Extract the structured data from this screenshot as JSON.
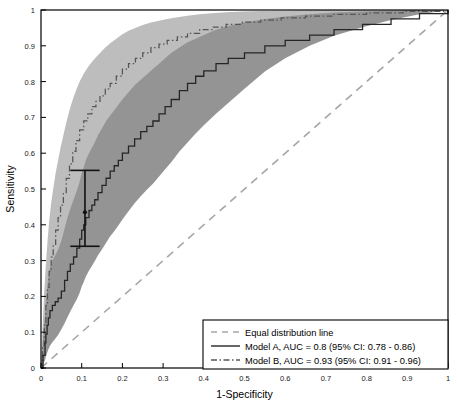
{
  "chart_data": {
    "type": "line",
    "title": "",
    "xlabel": "1-Specificity",
    "ylabel": "Sensitivity",
    "xlim": [
      0,
      1
    ],
    "ylim": [
      0,
      1
    ],
    "grid": false,
    "legend_position": "lower right",
    "xticks": [
      "0",
      "0.1",
      "0.2",
      "0.3",
      "0.4",
      "0.5",
      "0.6",
      "0.7",
      "0.8",
      "0.9",
      "1"
    ],
    "yticks": [
      "0",
      "0.1",
      "0.2",
      "0.3",
      "0.4",
      "0.5",
      "0.6",
      "0.7",
      "0.8",
      "0.9",
      "1"
    ],
    "xtick_values": [
      0,
      0.1,
      0.2,
      0.3,
      0.4,
      0.5,
      0.6,
      0.7,
      0.8,
      0.9,
      1
    ],
    "ytick_values": [
      0,
      0.1,
      0.2,
      0.3,
      0.4,
      0.5,
      0.6,
      0.7,
      0.8,
      0.9,
      1
    ],
    "colors": {
      "model_a_line": "#262626",
      "model_b_line": "#555555",
      "model_a_band": "#949494",
      "model_b_band": "#bdbdbd",
      "diagonal": "#a6a6a6",
      "axis": "#000000",
      "errorbar": "#111111"
    },
    "series": [
      {
        "name": "Equal distribution line",
        "style": "dashed",
        "x": [
          0,
          1
        ],
        "values": [
          0,
          1
        ]
      },
      {
        "name": "Model A",
        "style": "solid",
        "auc": 0.8,
        "ci_low": 0.78,
        "ci_high": 0.86,
        "x": [
          0,
          0.005,
          0.01,
          0.012,
          0.015,
          0.018,
          0.022,
          0.028,
          0.035,
          0.042,
          0.05,
          0.058,
          0.065,
          0.072,
          0.08,
          0.088,
          0.095,
          0.1,
          0.105,
          0.11,
          0.118,
          0.125,
          0.132,
          0.14,
          0.15,
          0.16,
          0.17,
          0.18,
          0.19,
          0.2,
          0.215,
          0.23,
          0.245,
          0.26,
          0.275,
          0.29,
          0.305,
          0.32,
          0.34,
          0.36,
          0.38,
          0.4,
          0.43,
          0.46,
          0.5,
          0.55,
          0.6,
          0.66,
          0.72,
          0.79,
          0.86,
          0.93,
          1.0
        ],
        "values": [
          0,
          0.035,
          0.07,
          0.095,
          0.12,
          0.14,
          0.16,
          0.175,
          0.185,
          0.195,
          0.215,
          0.245,
          0.27,
          0.29,
          0.31,
          0.335,
          0.36,
          0.385,
          0.4,
          0.42,
          0.44,
          0.455,
          0.47,
          0.49,
          0.51,
          0.53,
          0.55,
          0.565,
          0.58,
          0.6,
          0.62,
          0.64,
          0.66,
          0.675,
          0.69,
          0.71,
          0.73,
          0.75,
          0.775,
          0.795,
          0.815,
          0.83,
          0.85,
          0.865,
          0.88,
          0.9,
          0.915,
          0.93,
          0.945,
          0.96,
          0.975,
          0.99,
          1.0
        ],
        "band_upper": [
          0,
          0.08,
          0.15,
          0.19,
          0.225,
          0.255,
          0.28,
          0.3,
          0.315,
          0.33,
          0.355,
          0.39,
          0.42,
          0.445,
          0.47,
          0.495,
          0.52,
          0.545,
          0.56,
          0.58,
          0.6,
          0.615,
          0.63,
          0.65,
          0.67,
          0.69,
          0.705,
          0.72,
          0.735,
          0.75,
          0.77,
          0.79,
          0.805,
          0.82,
          0.835,
          0.85,
          0.865,
          0.88,
          0.895,
          0.91,
          0.92,
          0.93,
          0.945,
          0.955,
          0.965,
          0.975,
          0.982,
          0.988,
          0.993,
          0.996,
          0.998,
          1.0,
          1.0
        ],
        "band_lower": [
          0,
          0.01,
          0.022,
          0.032,
          0.042,
          0.052,
          0.062,
          0.072,
          0.082,
          0.092,
          0.108,
          0.125,
          0.142,
          0.158,
          0.175,
          0.192,
          0.21,
          0.228,
          0.24,
          0.255,
          0.272,
          0.285,
          0.298,
          0.315,
          0.332,
          0.35,
          0.368,
          0.382,
          0.398,
          0.415,
          0.438,
          0.46,
          0.48,
          0.498,
          0.515,
          0.535,
          0.555,
          0.575,
          0.605,
          0.63,
          0.655,
          0.678,
          0.71,
          0.74,
          0.78,
          0.828,
          0.865,
          0.9,
          0.928,
          0.952,
          0.972,
          0.988,
          1.0
        ]
      },
      {
        "name": "Model B",
        "style": "dash-dot",
        "auc": 0.93,
        "ci_low": 0.91,
        "ci_high": 0.96,
        "x": [
          0,
          0.004,
          0.008,
          0.012,
          0.016,
          0.02,
          0.025,
          0.03,
          0.036,
          0.042,
          0.048,
          0.055,
          0.062,
          0.07,
          0.078,
          0.086,
          0.095,
          0.105,
          0.115,
          0.125,
          0.135,
          0.145,
          0.158,
          0.17,
          0.185,
          0.2,
          0.215,
          0.232,
          0.25,
          0.27,
          0.29,
          0.31,
          0.335,
          0.36,
          0.39,
          0.42,
          0.455,
          0.495,
          0.54,
          0.59,
          0.65,
          0.72,
          0.8,
          0.89,
          1.0
        ],
        "values": [
          0,
          0.06,
          0.12,
          0.175,
          0.225,
          0.27,
          0.31,
          0.345,
          0.385,
          0.42,
          0.455,
          0.49,
          0.53,
          0.57,
          0.605,
          0.635,
          0.665,
          0.69,
          0.71,
          0.73,
          0.745,
          0.76,
          0.78,
          0.795,
          0.815,
          0.835,
          0.85,
          0.865,
          0.88,
          0.895,
          0.905,
          0.915,
          0.925,
          0.935,
          0.945,
          0.952,
          0.96,
          0.966,
          0.972,
          0.978,
          0.983,
          0.988,
          0.992,
          0.996,
          1.0
        ],
        "band_upper": [
          0,
          0.115,
          0.215,
          0.29,
          0.355,
          0.41,
          0.46,
          0.5,
          0.545,
          0.58,
          0.615,
          0.65,
          0.685,
          0.72,
          0.75,
          0.775,
          0.8,
          0.822,
          0.84,
          0.855,
          0.868,
          0.88,
          0.895,
          0.907,
          0.92,
          0.932,
          0.942,
          0.95,
          0.958,
          0.965,
          0.97,
          0.975,
          0.98,
          0.984,
          0.988,
          0.991,
          0.994,
          0.996,
          0.997,
          0.998,
          0.999,
          1.0,
          1.0,
          1.0,
          1.0
        ],
        "band_lower": [
          0,
          0.022,
          0.048,
          0.075,
          0.102,
          0.13,
          0.16,
          0.188,
          0.218,
          0.245,
          0.272,
          0.3,
          0.332,
          0.365,
          0.398,
          0.428,
          0.46,
          0.492,
          0.52,
          0.548,
          0.572,
          0.595,
          0.622,
          0.648,
          0.678,
          0.706,
          0.73,
          0.752,
          0.775,
          0.798,
          0.818,
          0.836,
          0.856,
          0.874,
          0.895,
          0.91,
          0.926,
          0.94,
          0.952,
          0.962,
          0.972,
          0.98,
          0.987,
          0.993,
          1.0
        ]
      }
    ],
    "annotations": [
      {
        "name": "error-bar",
        "x": 0.108,
        "y": 0.435,
        "y_low": 0.34,
        "y_high": 0.552,
        "cap_width": 0.036
      }
    ]
  },
  "legend": {
    "entries": [
      {
        "label": "Equal distribution line",
        "style": "dashed"
      },
      {
        "label": "Model A, AUC = 0.8 (95% CI: 0.78 - 0.86)",
        "style": "solid"
      },
      {
        "label": "Model B, AUC = 0.93 (95% CI: 0.91 - 0.96)",
        "style": "dash-dot"
      }
    ]
  }
}
